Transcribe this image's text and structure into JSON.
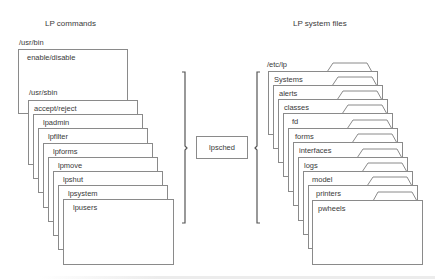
{
  "titles": {
    "left": "LP commands",
    "right": "LP system files"
  },
  "left_stack": {
    "bin_path": "/usr/bin",
    "bin_items": [
      {
        "label": "enable/disable"
      }
    ],
    "sbin_path": "/usr/sbin",
    "sbin_items": [
      {
        "label": "accept/reject"
      },
      {
        "label": "lpadmin"
      },
      {
        "label": "lpfilter"
      },
      {
        "label": "lpforms"
      },
      {
        "label": "lpmove"
      },
      {
        "label": "lpshut"
      },
      {
        "label": "lpsystem"
      },
      {
        "label": "lpusers"
      }
    ]
  },
  "center": {
    "daemon": "lpsched"
  },
  "right_stack": {
    "path": "/etc/lp",
    "folders": [
      {
        "label": "Systems"
      },
      {
        "label": "alerts"
      },
      {
        "label": "classes"
      },
      {
        "label": "fd"
      },
      {
        "label": "forms"
      },
      {
        "label": "interfaces"
      },
      {
        "label": "logs"
      },
      {
        "label": "model"
      },
      {
        "label": "printers"
      },
      {
        "label": "pwheels"
      }
    ]
  },
  "colors": {
    "line": "#8a8a8a",
    "bracket": "#555555",
    "text": "#3a3a3a"
  }
}
